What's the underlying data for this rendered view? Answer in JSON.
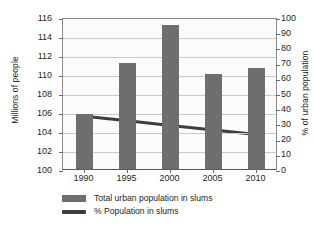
{
  "chart_data": {
    "type": "bar",
    "title": "",
    "xlabel": "",
    "ylabel": "Millions of people",
    "y2label": "% of urban population",
    "categories": [
      "1990",
      "1995",
      "2000",
      "2005",
      "2010"
    ],
    "ylim": [
      100,
      116
    ],
    "y2lim": [
      0,
      100
    ],
    "yticks": [
      100,
      102,
      104,
      106,
      108,
      110,
      112,
      114,
      116
    ],
    "y2ticks": [
      0,
      10,
      20,
      30,
      40,
      50,
      60,
      70,
      80,
      90,
      100
    ],
    "grid": true,
    "legend_position": "bottom-left",
    "series": [
      {
        "name": "Total urban population in slums",
        "type": "bar",
        "axis": "left",
        "color": "#6e6e6e",
        "values": [
          105.8,
          111.2,
          115.2,
          110.0,
          110.6
        ]
      },
      {
        "name": "% Population in slums",
        "type": "line",
        "axis": "right",
        "color": "#3d3d3d",
        "values": [
          36,
          33,
          30,
          27,
          24
        ]
      }
    ]
  },
  "axes": {
    "left_title": "Millions of people",
    "right_title": "% of urban population",
    "left_ticks": [
      "116",
      "114",
      "112",
      "110",
      "108",
      "106",
      "104",
      "102",
      "100"
    ],
    "right_ticks": [
      "100",
      "90",
      "80",
      "70",
      "60",
      "50",
      "40",
      "30",
      "20",
      "10",
      "0"
    ],
    "x_ticks": [
      "1990",
      "1995",
      "2000",
      "2005",
      "2010"
    ]
  },
  "legend": {
    "items": [
      {
        "label": "Total urban population in slums",
        "swatch": "bar-swatch",
        "color": "#6e6e6e"
      },
      {
        "label": "% Population in slums",
        "swatch": "line-swatch",
        "color": "#3d3d3d"
      }
    ]
  }
}
